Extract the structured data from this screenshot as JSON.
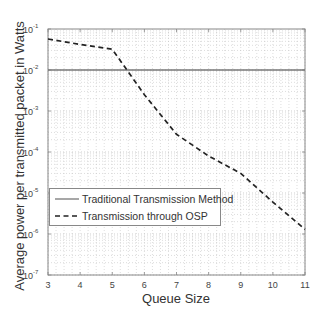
{
  "chart_data": {
    "type": "line",
    "title": "",
    "xlabel": "Queue Size",
    "ylabel": "Average power per transmitted packet in Watts",
    "xlim": [
      3,
      11
    ],
    "ylim": [
      1e-07,
      0.1
    ],
    "yscale": "log",
    "grid": true,
    "grid_style": "dotted",
    "x_ticks": [
      3,
      4,
      5,
      6,
      7,
      8,
      9,
      10,
      11
    ],
    "x_tick_labels": [
      "3",
      "4",
      "5",
      "6",
      "7",
      "8",
      "9",
      "10",
      "11"
    ],
    "y_ticks": [
      0.1,
      0.01,
      0.001,
      0.0001,
      1e-05,
      1e-06,
      1e-07
    ],
    "y_tick_exponents": [
      "-1",
      "-2",
      "-3",
      "-4",
      "-5",
      "-6",
      "-7"
    ],
    "x": [
      3,
      4,
      5,
      6,
      7,
      8,
      9,
      10,
      11
    ],
    "series": [
      {
        "name": "Traditional Transmission Method",
        "style": "solid",
        "color": "#777777",
        "values": [
          0.01,
          0.01,
          0.01,
          0.01,
          0.01,
          0.01,
          0.01,
          0.01,
          0.01
        ]
      },
      {
        "name": "Transmission through OSP",
        "style": "dashed",
        "color": "#222222",
        "values": [
          0.057,
          0.042,
          0.032,
          0.0025,
          0.00027,
          8e-05,
          3e-05,
          6e-06,
          1.3e-06
        ]
      }
    ],
    "legend_position": "lower left"
  },
  "labels": {
    "ylabel": "Average power per transmitted packet in Watts",
    "xlabel": "Queue Size",
    "legend": [
      "Traditional Transmission Method",
      "Transmission through OSP"
    ]
  }
}
